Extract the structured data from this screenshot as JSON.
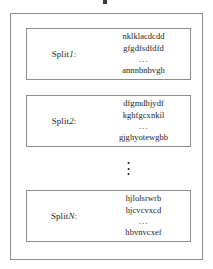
{
  "figure": {
    "kind": "diagram",
    "top_mark": "",
    "vertical_ellipsis": "⋮",
    "colors": {
      "background": "#ffffff",
      "border": "#8d8d8d",
      "text": "#1d1d1d"
    }
  },
  "splits": [
    {
      "label_prefix": "Split",
      "label_index": "1",
      "label_suffix": ":",
      "lines": [
        "nklklacdcdd",
        "gfgdfsdfdfd",
        "...",
        "annnbnbvgh"
      ]
    },
    {
      "label_prefix": "Split",
      "label_index": "2",
      "label_suffix": ":",
      "lines": [
        "dfgmdhjydf",
        "kghfgcxnkil",
        "...",
        "gjghyotewgbb"
      ]
    },
    {
      "label_prefix": "Split",
      "label_index": "N",
      "label_suffix": ":",
      "lines": [
        "hjlolsrwrb",
        "hjcvcvxcd",
        "...",
        "hbvnvcxef"
      ]
    }
  ]
}
